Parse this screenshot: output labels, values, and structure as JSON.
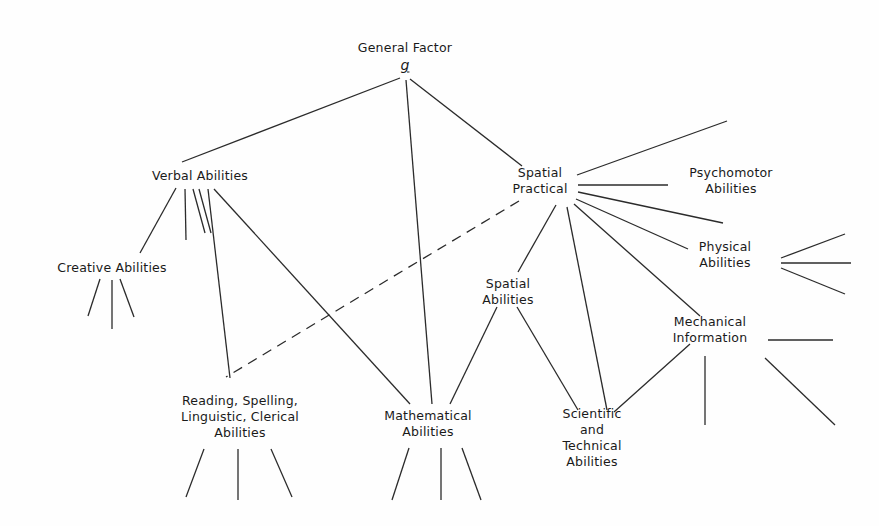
{
  "figure": {
    "background_color": "#fefefe",
    "line_color": "#2b2b2b",
    "text_color": "#1a1a1a"
  },
  "nodes": {
    "general_factor": {
      "title": "General Factor",
      "symbol": "g",
      "x": 405,
      "y": 56
    },
    "verbal": {
      "label": "Verbal Abilities",
      "x": 200,
      "y": 176
    },
    "spatial_practical": {
      "label": "Spatial\nPractical",
      "x": 540,
      "y": 181
    },
    "psychomotor": {
      "label": "Psychomotor\nAbilities",
      "x": 731,
      "y": 181
    },
    "physical": {
      "label": "Physical\nAbilities",
      "x": 725,
      "y": 255
    },
    "mechanical": {
      "label": "Mechanical\nInformation",
      "x": 710,
      "y": 330
    },
    "creative": {
      "label": "Creative  Abilities",
      "x": 112,
      "y": 268
    },
    "spatial_abilities": {
      "label": "Spatial\nAbilities",
      "x": 508,
      "y": 292
    },
    "reading": {
      "label": "Reading, Spelling,\nLinguistic, Clerical\nAbilities",
      "x": 240,
      "y": 417
    },
    "mathematical": {
      "label": "Mathematical\nAbilities",
      "x": 428,
      "y": 424
    },
    "scientific": {
      "label": "Scientific\nand\nTechnical\nAbilities",
      "x": 592,
      "y": 438
    }
  },
  "edges": [
    {
      "name": "g-to-verbal",
      "x1": 400,
      "y1": 78,
      "x2": 182,
      "y2": 162,
      "style": "solid"
    },
    {
      "name": "g-to-mathematical",
      "x1": 406,
      "y1": 80,
      "x2": 432,
      "y2": 404,
      "style": "solid"
    },
    {
      "name": "g-to-spatial-practical",
      "x1": 410,
      "y1": 79,
      "x2": 522,
      "y2": 166,
      "style": "solid"
    },
    {
      "name": "verbal-to-creative",
      "x1": 176,
      "y1": 188,
      "x2": 140,
      "y2": 253,
      "style": "solid"
    },
    {
      "name": "verbal-stub-1",
      "x1": 185,
      "y1": 189,
      "x2": 186,
      "y2": 240,
      "style": "solid"
    },
    {
      "name": "verbal-stub-2",
      "x1": 193,
      "y1": 189,
      "x2": 205,
      "y2": 233,
      "style": "solid"
    },
    {
      "name": "verbal-stub-3",
      "x1": 199,
      "y1": 189,
      "x2": 211,
      "y2": 233,
      "style": "solid"
    },
    {
      "name": "verbal-to-reading",
      "x1": 208,
      "y1": 189,
      "x2": 230,
      "y2": 378,
      "style": "solid"
    },
    {
      "name": "verbal-to-mathematical",
      "x1": 214,
      "y1": 189,
      "x2": 410,
      "y2": 404,
      "style": "solid"
    },
    {
      "name": "spatial-practical-to-upper-right",
      "x1": 577,
      "y1": 175,
      "x2": 727,
      "y2": 121,
      "style": "solid"
    },
    {
      "name": "spatial-practical-to-psychomotor",
      "x1": 578,
      "y1": 185,
      "x2": 668,
      "y2": 185,
      "style": "solid"
    },
    {
      "name": "spatial-practical-to-psychomotor-lower",
      "x1": 578,
      "y1": 192,
      "x2": 723,
      "y2": 223,
      "style": "solid"
    },
    {
      "name": "spatial-practical-to-physical",
      "x1": 576,
      "y1": 199,
      "x2": 688,
      "y2": 249,
      "style": "solid"
    },
    {
      "name": "spatial-practical-to-mechanical",
      "x1": 574,
      "y1": 204,
      "x2": 700,
      "y2": 316,
      "style": "solid"
    },
    {
      "name": "spatial-practical-to-scientific",
      "x1": 567,
      "y1": 207,
      "x2": 607,
      "y2": 410,
      "style": "solid"
    },
    {
      "name": "spatial-practical-to-spatial-abilities",
      "x1": 556,
      "y1": 205,
      "x2": 518,
      "y2": 272,
      "style": "solid"
    },
    {
      "name": "spatial-practical-to-reading-dashed",
      "x1": 519,
      "y1": 201,
      "x2": 226,
      "y2": 377,
      "style": "dashed"
    },
    {
      "name": "creative-stub-1",
      "x1": 100,
      "y1": 279,
      "x2": 88,
      "y2": 316,
      "style": "solid"
    },
    {
      "name": "creative-stub-2",
      "x1": 112,
      "y1": 280,
      "x2": 112,
      "y2": 329,
      "style": "solid"
    },
    {
      "name": "creative-stub-3",
      "x1": 120,
      "y1": 279,
      "x2": 134,
      "y2": 317,
      "style": "solid"
    },
    {
      "name": "spatial-abilities-to-mathematical",
      "x1": 497,
      "y1": 307,
      "x2": 450,
      "y2": 404,
      "style": "solid"
    },
    {
      "name": "spatial-abilities-to-scientific",
      "x1": 517,
      "y1": 307,
      "x2": 578,
      "y2": 410,
      "style": "solid"
    },
    {
      "name": "mechanical-from-scientific",
      "x1": 690,
      "y1": 344,
      "x2": 614,
      "y2": 412,
      "style": "solid"
    },
    {
      "name": "mechanical-stub-horizontal",
      "x1": 768,
      "y1": 340,
      "x2": 833,
      "y2": 340,
      "style": "solid"
    },
    {
      "name": "mechanical-stub-vertical",
      "x1": 705,
      "y1": 356,
      "x2": 705,
      "y2": 425,
      "style": "solid"
    },
    {
      "name": "mechanical-stub-diagonal",
      "x1": 765,
      "y1": 358,
      "x2": 835,
      "y2": 425,
      "style": "solid"
    },
    {
      "name": "physical-stub-up",
      "x1": 781,
      "y1": 258,
      "x2": 845,
      "y2": 234,
      "style": "solid"
    },
    {
      "name": "physical-stub-mid",
      "x1": 781,
      "y1": 263,
      "x2": 851,
      "y2": 263,
      "style": "solid"
    },
    {
      "name": "physical-stub-down",
      "x1": 781,
      "y1": 268,
      "x2": 845,
      "y2": 294,
      "style": "solid"
    },
    {
      "name": "reading-stub-1",
      "x1": 204,
      "y1": 449,
      "x2": 186,
      "y2": 497,
      "style": "solid"
    },
    {
      "name": "reading-stub-2",
      "x1": 238,
      "y1": 449,
      "x2": 238,
      "y2": 500,
      "style": "solid"
    },
    {
      "name": "reading-stub-3",
      "x1": 271,
      "y1": 449,
      "x2": 292,
      "y2": 497,
      "style": "solid"
    },
    {
      "name": "mathematical-stub-1",
      "x1": 409,
      "y1": 448,
      "x2": 392,
      "y2": 500,
      "style": "solid"
    },
    {
      "name": "mathematical-stub-2",
      "x1": 441,
      "y1": 448,
      "x2": 441,
      "y2": 500,
      "style": "solid"
    },
    {
      "name": "mathematical-stub-3",
      "x1": 462,
      "y1": 448,
      "x2": 481,
      "y2": 500,
      "style": "solid"
    }
  ]
}
